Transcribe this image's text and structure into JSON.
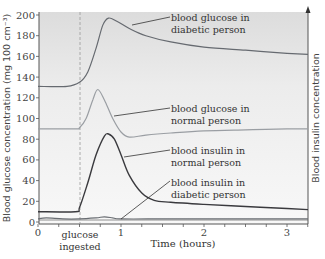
{
  "chart_data": {
    "type": "line",
    "title": "",
    "xlabel": "Time (hours)",
    "ylabel": "Blood glucose concentration (mg 100 cm⁻³)",
    "ylabel_right": "Blood insulin concentration",
    "xlim": [
      0,
      3.3
    ],
    "ylim": [
      0,
      200
    ],
    "x_ticks": [
      0,
      1,
      2,
      3
    ],
    "x_tick_labels": [
      "0",
      "1",
      "2",
      "3"
    ],
    "x_minor_step": 0.25,
    "y_ticks": [
      0,
      20,
      40,
      60,
      80,
      100,
      120,
      140,
      160,
      180,
      200
    ],
    "y_tick_labels": [
      "0",
      "20",
      "40",
      "60",
      "80",
      "100",
      "120",
      "140",
      "160",
      "180",
      "200"
    ],
    "grid": false,
    "annotations": [
      {
        "text": "glucose ingested",
        "x": 0.5,
        "style": "dashed vertical line"
      }
    ],
    "series": [
      {
        "name": "blood glucose in diabetic person",
        "color": "#666a70",
        "x": [
          0,
          0.35,
          0.5,
          0.6,
          0.7,
          0.78,
          0.85,
          0.95,
          1.1,
          1.3,
          1.6,
          2.0,
          2.5,
          3.0,
          3.3
        ],
        "values": [
          131,
          131,
          135,
          145,
          168,
          190,
          197,
          194,
          187,
          180,
          174,
          169,
          166,
          163,
          162
        ]
      },
      {
        "name": "blood glucose in normal person",
        "color": "#9a9ea3",
        "x": [
          0,
          0.45,
          0.5,
          0.58,
          0.66,
          0.72,
          0.8,
          0.9,
          1.0,
          1.1,
          1.3,
          1.6,
          2.0,
          2.5,
          3.0,
          3.3
        ],
        "values": [
          90,
          90,
          91,
          100,
          118,
          128,
          118,
          100,
          87,
          82,
          84,
          86,
          88,
          89,
          90,
          90
        ]
      },
      {
        "name": "blood insulin in normal person",
        "color": "#3a3a3e",
        "x": [
          0,
          0.45,
          0.5,
          0.6,
          0.7,
          0.8,
          0.85,
          0.92,
          1.0,
          1.1,
          1.25,
          1.4,
          1.6,
          2.0,
          2.5,
          3.0,
          3.3
        ],
        "values": [
          10,
          10,
          14,
          38,
          65,
          83,
          85,
          80,
          65,
          45,
          28,
          21,
          19,
          17,
          15,
          13,
          12
        ]
      },
      {
        "name": "blood insulin in diabetic person",
        "color": "#6a6e73",
        "x": [
          0,
          0.1,
          0.3,
          0.5,
          0.7,
          0.8,
          0.9,
          1.0,
          1.5,
          2.0,
          3.0,
          3.3
        ],
        "values": [
          3,
          4,
          3,
          3,
          4,
          5,
          4,
          3,
          3,
          3,
          3,
          3
        ]
      }
    ],
    "labels": [
      {
        "series": 0,
        "line1": "blood glucose in",
        "line2": "diabetic person"
      },
      {
        "series": 1,
        "line1": "blood glucose in",
        "line2": "normal person"
      },
      {
        "series": 2,
        "line1": "blood insulin in",
        "line2": "normal person"
      },
      {
        "series": 3,
        "line1": "blood insulin in",
        "line2": "diabetic person"
      }
    ]
  },
  "text": {
    "ylabel": "Blood glucose concentration (mg 100 cm⁻³)",
    "ylabel_right": "Blood insulin concentration",
    "xlabel": "Time (hours)",
    "glucose_line1": "glucose",
    "glucose_line2": "ingested",
    "lbl_dg_1": "blood glucose in",
    "lbl_dg_2": "diabetic person",
    "lbl_ng_1": "blood glucose in",
    "lbl_ng_2": "normal person",
    "lbl_ni_1": "blood insulin in",
    "lbl_ni_2": "normal person",
    "lbl_di_1": "blood insulin in",
    "lbl_di_2": "diabetic person"
  }
}
